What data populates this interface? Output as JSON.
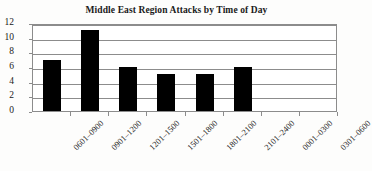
{
  "chart_data": {
    "type": "bar",
    "title": "Middle East Region Attacks by Time of Day",
    "xlabel": "",
    "ylabel": "",
    "categories": [
      "0601–0900",
      "0901–1200",
      "1201–1500",
      "1501–1800",
      "1801–2100",
      "2101–2400",
      "0001–0300",
      "0301–0600"
    ],
    "values": [
      7,
      11,
      6,
      5,
      5,
      6,
      0,
      0
    ],
    "ylim": [
      0,
      12
    ],
    "yticks": [
      0,
      2,
      4,
      6,
      8,
      10,
      12
    ],
    "ytick_labels": [
      "0",
      "2",
      "4",
      "6",
      "8",
      "10",
      "12"
    ],
    "grid": true,
    "grid_axis": "y",
    "legend": false,
    "legend_position": "none",
    "bar_color": "#000000",
    "grid_color": "#8c8c8c",
    "plot_background": "#ffffff",
    "figure_background": "#fdfdfc",
    "text_color": "#1a1a1a",
    "xtick_rotation": -45
  }
}
